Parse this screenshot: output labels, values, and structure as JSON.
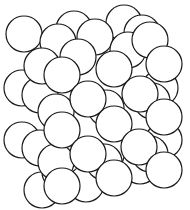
{
  "diagram": {
    "title": "",
    "stroke_color": "#1a1a1a",
    "fill_color": "#ffffff",
    "radius": 18,
    "layers": [
      {
        "name": "back",
        "spheres": [
          [
            24,
            34
          ],
          [
            74,
            29
          ],
          [
            124,
            23
          ],
          [
            22,
            88
          ],
          [
            22,
            140
          ],
          [
            42,
            190
          ]
        ]
      },
      {
        "name": "middle-back",
        "spheres": [
          [
            58,
            42
          ],
          [
            95,
            37
          ],
          [
            142,
            33
          ],
          [
            40,
            95
          ],
          [
            40,
            148
          ],
          [
            60,
            172
          ],
          [
            86,
            184
          ],
          [
            140,
            166
          ],
          [
            164,
            140
          ],
          [
            160,
            88
          ]
        ]
      },
      {
        "name": "middle",
        "spheres": [
          [
            42,
            66
          ],
          [
            78,
            57
          ],
          [
            128,
            50
          ],
          [
            150,
            40
          ],
          [
            56,
            112
          ],
          [
            106,
            108
          ],
          [
            152,
            101
          ],
          [
            56,
            162
          ],
          [
            104,
            162
          ],
          [
            150,
            154
          ]
        ]
      },
      {
        "name": "front",
        "spheres": [
          [
            62,
            75
          ],
          [
            114,
            69
          ],
          [
            164,
            64
          ],
          [
            88,
            99
          ],
          [
            140,
            94
          ],
          [
            62,
            130
          ],
          [
            114,
            124
          ],
          [
            164,
            117
          ],
          [
            88,
            154
          ],
          [
            139,
            147
          ],
          [
            62,
            186
          ],
          [
            114,
            178
          ],
          [
            164,
            170
          ]
        ]
      }
    ]
  }
}
